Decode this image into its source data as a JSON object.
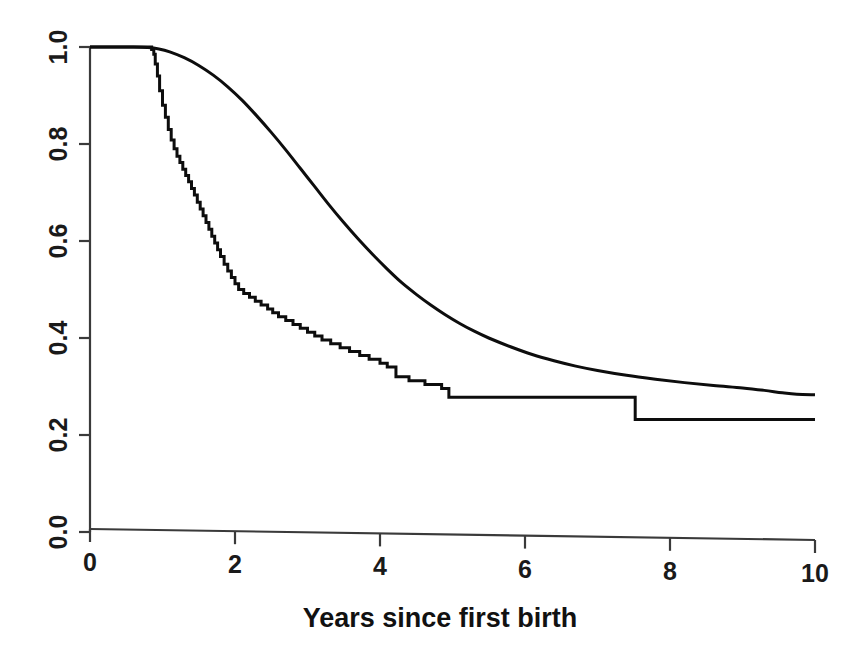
{
  "chart_data": {
    "type": "line",
    "title": "",
    "xlabel": "Years since first birth",
    "ylabel": "",
    "xlim": [
      0,
      10
    ],
    "ylim": [
      0.0,
      1.0
    ],
    "grid": false,
    "legend": "none",
    "xticks": [
      0,
      2,
      4,
      6,
      8,
      10
    ],
    "xtick_labels": [
      "0",
      "2",
      "4",
      "6",
      "8",
      "10"
    ],
    "yticks": [
      0.0,
      0.2,
      0.4,
      0.6,
      0.8,
      1.0
    ],
    "ytick_labels": [
      "0.0",
      "0.2",
      "0.4",
      "0.6",
      "0.8",
      "1.0"
    ],
    "ytick_label_rotation": 90,
    "series": [
      {
        "name": "kaplan-meier-step-curve",
        "style": "step",
        "color": "#0d0d0d",
        "points": [
          [
            0.0,
            1.0
          ],
          [
            0.8,
            1.0
          ],
          [
            0.85,
            0.995
          ],
          [
            0.88,
            0.985
          ],
          [
            0.9,
            0.965
          ],
          [
            0.93,
            0.94
          ],
          [
            0.96,
            0.91
          ],
          [
            1.0,
            0.88
          ],
          [
            1.04,
            0.855
          ],
          [
            1.08,
            0.83
          ],
          [
            1.12,
            0.808
          ],
          [
            1.16,
            0.79
          ],
          [
            1.2,
            0.775
          ],
          [
            1.24,
            0.762
          ],
          [
            1.28,
            0.748
          ],
          [
            1.32,
            0.735
          ],
          [
            1.36,
            0.722
          ],
          [
            1.4,
            0.708
          ],
          [
            1.44,
            0.695
          ],
          [
            1.48,
            0.68
          ],
          [
            1.52,
            0.666
          ],
          [
            1.56,
            0.652
          ],
          [
            1.6,
            0.638
          ],
          [
            1.64,
            0.624
          ],
          [
            1.68,
            0.61
          ],
          [
            1.72,
            0.596
          ],
          [
            1.76,
            0.582
          ],
          [
            1.8,
            0.568
          ],
          [
            1.85,
            0.552
          ],
          [
            1.9,
            0.538
          ],
          [
            1.95,
            0.525
          ],
          [
            2.0,
            0.512
          ],
          [
            2.05,
            0.5
          ],
          [
            2.12,
            0.492
          ],
          [
            2.2,
            0.484
          ],
          [
            2.28,
            0.476
          ],
          [
            2.36,
            0.468
          ],
          [
            2.45,
            0.46
          ],
          [
            2.52,
            0.452
          ],
          [
            2.6,
            0.444
          ],
          [
            2.7,
            0.436
          ],
          [
            2.8,
            0.428
          ],
          [
            2.9,
            0.42
          ],
          [
            3.0,
            0.412
          ],
          [
            3.1,
            0.404
          ],
          [
            3.2,
            0.396
          ],
          [
            3.32,
            0.388
          ],
          [
            3.45,
            0.38
          ],
          [
            3.58,
            0.372
          ],
          [
            3.72,
            0.364
          ],
          [
            3.85,
            0.356
          ],
          [
            4.0,
            0.348
          ],
          [
            4.1,
            0.34
          ],
          [
            4.22,
            0.32
          ],
          [
            4.4,
            0.312
          ],
          [
            4.62,
            0.304
          ],
          [
            4.85,
            0.296
          ],
          [
            4.95,
            0.278
          ],
          [
            7.5,
            0.278
          ],
          [
            7.52,
            0.232
          ],
          [
            10.0,
            0.232
          ]
        ]
      },
      {
        "name": "smooth-model-curve",
        "style": "smooth",
        "color": "#0d0d0d",
        "points": [
          [
            0.0,
            1.0
          ],
          [
            0.6,
            1.0
          ],
          [
            0.8,
            0.999
          ],
          [
            0.95,
            0.996
          ],
          [
            1.1,
            0.99
          ],
          [
            1.3,
            0.978
          ],
          [
            1.5,
            0.962
          ],
          [
            1.7,
            0.942
          ],
          [
            1.9,
            0.918
          ],
          [
            2.1,
            0.89
          ],
          [
            2.3,
            0.858
          ],
          [
            2.5,
            0.824
          ],
          [
            2.7,
            0.788
          ],
          [
            2.9,
            0.75
          ],
          [
            3.1,
            0.712
          ],
          [
            3.3,
            0.674
          ],
          [
            3.5,
            0.638
          ],
          [
            3.7,
            0.604
          ],
          [
            3.9,
            0.572
          ],
          [
            4.1,
            0.542
          ],
          [
            4.3,
            0.514
          ],
          [
            4.5,
            0.49
          ],
          [
            4.7,
            0.468
          ],
          [
            4.9,
            0.448
          ],
          [
            5.1,
            0.43
          ],
          [
            5.3,
            0.414
          ],
          [
            5.5,
            0.4
          ],
          [
            5.8,
            0.382
          ],
          [
            6.1,
            0.366
          ],
          [
            6.4,
            0.353
          ],
          [
            6.7,
            0.342
          ],
          [
            7.0,
            0.333
          ],
          [
            7.4,
            0.323
          ],
          [
            7.8,
            0.315
          ],
          [
            8.2,
            0.308
          ],
          [
            8.6,
            0.302
          ],
          [
            9.0,
            0.297
          ],
          [
            9.3,
            0.292
          ],
          [
            9.55,
            0.287
          ],
          [
            9.75,
            0.284
          ],
          [
            10.0,
            0.283
          ]
        ]
      }
    ]
  },
  "axes": {
    "plot_area": {
      "left": 90,
      "right": 815,
      "top": 47,
      "bottom": 532
    }
  }
}
